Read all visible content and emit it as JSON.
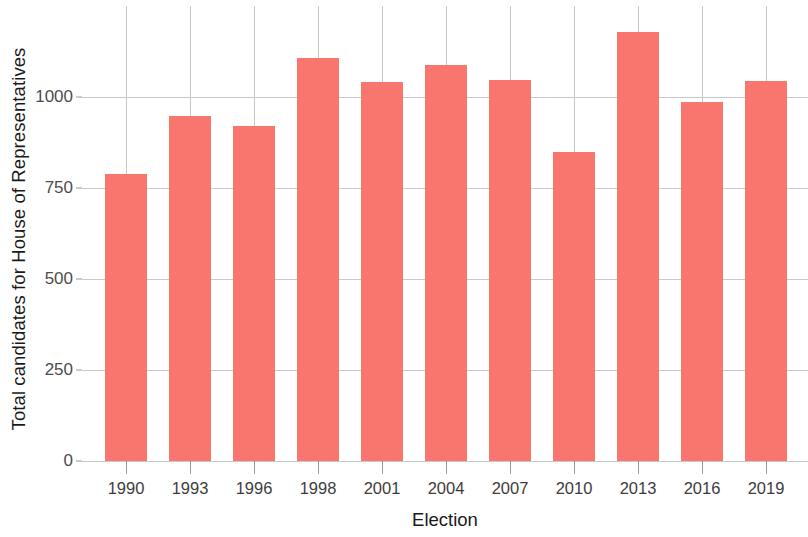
{
  "chart_data": {
    "type": "bar",
    "title": "",
    "subtitle": "",
    "xlabel": "Election",
    "ylabel": "Total candidates for House of Representatives",
    "categories": [
      "1990",
      "1993",
      "1996",
      "1998",
      "2001",
      "2004",
      "2007",
      "2010",
      "2013",
      "2016",
      "2019"
    ],
    "values": [
      788,
      948,
      920,
      1107,
      1041,
      1088,
      1047,
      848,
      1179,
      986,
      1044
    ],
    "series": [
      {
        "name": "Total candidates for House of Representatives",
        "values": [
          788,
          948,
          920,
          1107,
          1041,
          1088,
          1047,
          848,
          1179,
          986,
          1044
        ]
      }
    ],
    "ylim": [
      0,
      1250
    ],
    "yticks": [
      0,
      250,
      500,
      750,
      1000
    ],
    "ytick_labels": [
      "0",
      "250",
      "500",
      "750",
      "1000"
    ],
    "grid": true,
    "grid_axes": "both",
    "legend": false,
    "legend_position": "none",
    "bar_color": "#f8766d",
    "grid_color": "#c9c9c9",
    "background_color": "#ffffff",
    "annotations": []
  }
}
